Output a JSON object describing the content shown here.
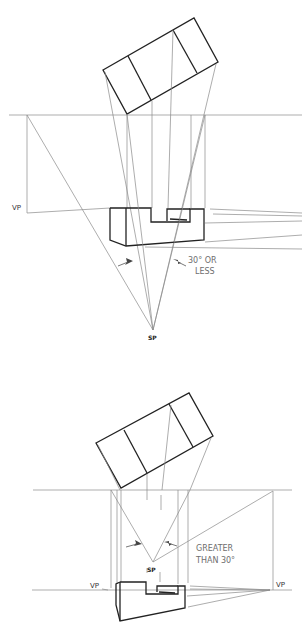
{
  "figure": {
    "colors": {
      "object_line": "#222222",
      "projection_line": "#8a8a8a",
      "note_text": "#6e6e6e"
    }
  },
  "top_diagram": {
    "vp_label": "VP",
    "sp_label": "SP",
    "note_line1": "30° OR",
    "note_line2": "LESS"
  },
  "bottom_diagram": {
    "vp_left_label": "VP",
    "vp_right_label": "VP",
    "sp_label": "SP",
    "note_line1": "GREATER",
    "note_line2": "THAN 30°"
  }
}
